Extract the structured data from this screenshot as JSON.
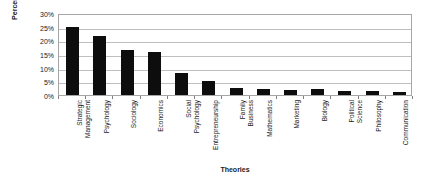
{
  "chart_data": {
    "type": "bar",
    "title": "",
    "xlabel": "Theories",
    "ylabel": "Percentage",
    "ylim": [
      0,
      30
    ],
    "ytick_values": [
      0,
      5,
      10,
      15,
      20,
      25,
      30
    ],
    "ytick_labels": [
      "0%",
      "5%",
      "10%",
      "15%",
      "20%",
      "25%",
      "30%"
    ],
    "grid": true,
    "legend": "none",
    "bar_color": "#0d0d0d",
    "gridline_color": "#bfbfbf",
    "frame_color": "#a6a6a6",
    "categories": [
      "Strategic Management",
      "Psychology",
      "Sociology",
      "Economics",
      "Social Psychology",
      "Entrepreneurship",
      "Family Business",
      "Mathematics",
      "Marketing",
      "Biology",
      "Political Science",
      "Philosophy",
      "Communication"
    ],
    "values": [
      25.0,
      21.7,
      16.5,
      15.8,
      8.2,
      5.0,
      2.5,
      2.2,
      2.0,
      2.2,
      1.3,
      1.3,
      1.2
    ]
  }
}
